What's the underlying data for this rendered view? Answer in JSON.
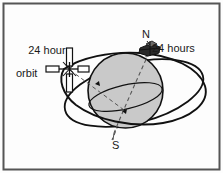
{
  "figure": {
    "frame": {
      "border_color": "#555555",
      "background_color": "#fdfdfd"
    },
    "labels": {
      "orbit_line1": "24 hour",
      "orbit_line2": "orbit",
      "period": "24 hours",
      "north_pole": "N",
      "south_pole": "S"
    },
    "colors": {
      "sphere_fill": "#c9c9c9",
      "line": "#111111",
      "axis_dashed": "#555555",
      "satellite_body": "#ffffff",
      "spacecraft_body": "#2a2a2a"
    },
    "elements": {
      "earth_name": "earth-sphere",
      "equator_name": "equator-ellipse",
      "orbit_name": "orbit-ellipse",
      "axis_name": "polar-axis",
      "satellite_name": "satellite-icon",
      "spacecraft_name": "spacecraft-icon",
      "sightline_name": "sight-line"
    }
  }
}
